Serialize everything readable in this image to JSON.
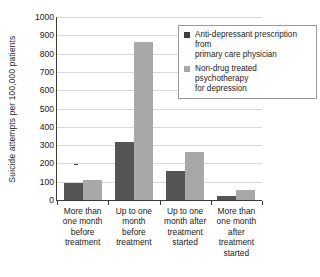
{
  "chart_data": {
    "type": "bar",
    "title": "",
    "xlabel": "",
    "ylabel": "Suicide attempts per 100,000 patients",
    "ylim": [
      0,
      1000
    ],
    "ytick_step": 100,
    "yticks": [
      "1000",
      "900",
      "800",
      "700",
      "600",
      "500",
      "400",
      "300",
      "200",
      "100",
      "0"
    ],
    "grid": "horizontal",
    "legend_position": "upper-right-inside",
    "categories": [
      "More than one month before treatment",
      "Up to one month before treatment",
      "Up to one month after treatment started",
      "More than one month after treatment started"
    ],
    "category_label_lines": [
      [
        "More than",
        "one month",
        "before",
        "treatment"
      ],
      [
        "Up to one",
        "month",
        "before",
        "treatment"
      ],
      [
        "Up to one",
        "month after",
        "treatment",
        "started"
      ],
      [
        "More than",
        "one month",
        "after",
        "treatment",
        "started"
      ]
    ],
    "series": [
      {
        "name": "Anti-depressant prescription from primary care physician",
        "label_lines": [
          "Anti-depressant prescription from",
          "primary care physician"
        ],
        "color": "#555555",
        "values": [
          95,
          315,
          160,
          20
        ]
      },
      {
        "name": "Non-drug treated psychotherapy for depression",
        "label_lines": [
          "Non-drug treated psychotherapy",
          "for depression"
        ],
        "color": "#a8a8a8",
        "values": [
          110,
          862,
          265,
          55
        ]
      }
    ]
  },
  "colors": {
    "series_a": "#555555",
    "series_b": "#a8a8a8",
    "gridline": "#d8d8d8",
    "axis": "#3a3a3a",
    "background": "#ffffff"
  }
}
